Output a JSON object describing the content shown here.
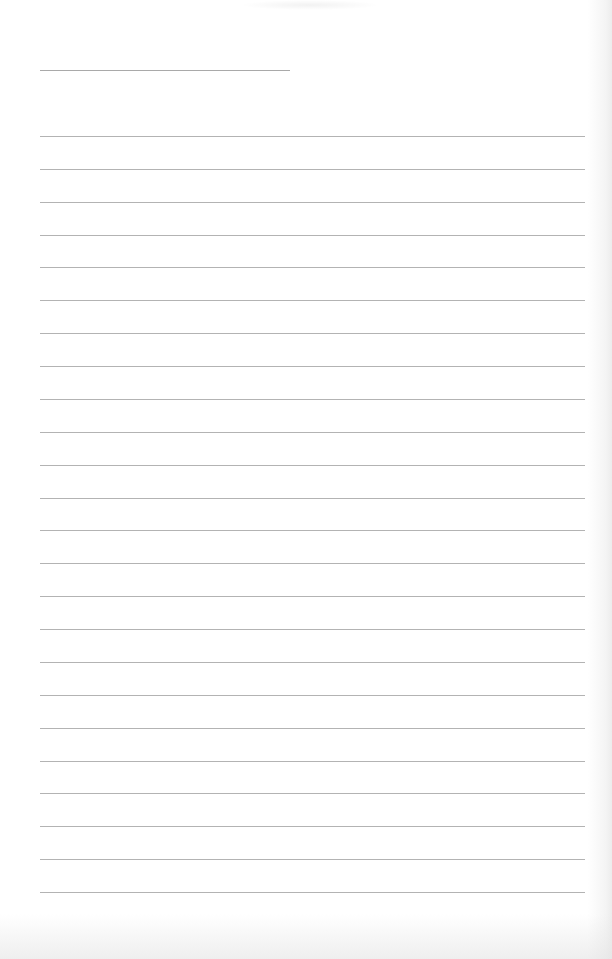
{
  "page": {
    "type": "lined notebook page",
    "background_color": "#ffffff",
    "line_color": "#b3b3b3",
    "title_line": {
      "y": 70,
      "x_start": 40,
      "x_end": 290
    },
    "ruled_lines": {
      "count": 24,
      "first_y": 136,
      "spacing": 32.87,
      "x_start": 40,
      "x_end": 585
    },
    "text_content": []
  }
}
